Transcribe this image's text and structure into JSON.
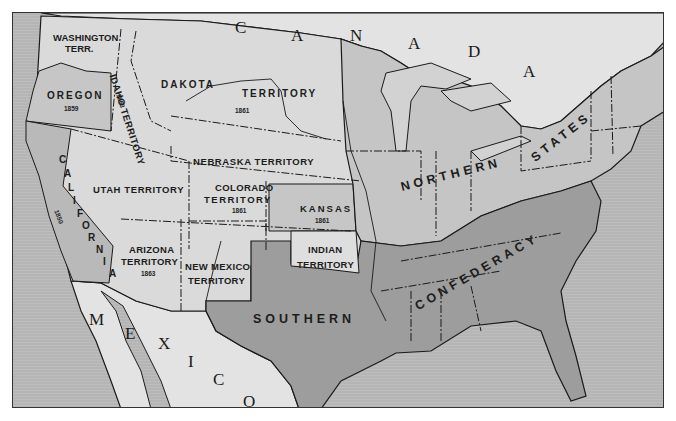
{
  "map": {
    "title": "United States, Territories and the Confederacy, c. 1861-1863",
    "colors": {
      "ocean": "#b5b5b5",
      "foreign_land": "#e2e2e2",
      "territory": "#d9d9d9",
      "northern_states": "#c4c4c4",
      "confederacy": "#9e9e9e",
      "border": "#1a1a1a",
      "frame": "#333333"
    },
    "countries": {
      "canada_letters": [
        "C",
        "A",
        "N",
        "A",
        "D",
        "A"
      ],
      "mexico_letters": [
        "M",
        "E",
        "X",
        "I",
        "C",
        "O"
      ]
    },
    "regions": {
      "washington": {
        "name_line1": "WASHINGTON",
        "name_line2": "TERR."
      },
      "oregon": {
        "name": "OREGON",
        "year": "1859"
      },
      "idaho": {
        "name": "IDAHO TERRITORY",
        "year": "1863"
      },
      "dakota": {
        "name_part1": "DAKOTA",
        "name_part2": "TERRITORY",
        "year": "1861"
      },
      "nebraska": {
        "name": "NEBRASKA TERRITORY"
      },
      "california": {
        "letters": [
          "C",
          "A",
          "L",
          "I",
          "F",
          "O",
          "R",
          "N",
          "I",
          "A"
        ],
        "year": "1850"
      },
      "utah": {
        "name": "UTAH TERRITORY"
      },
      "colorado": {
        "name_line1": "COLORADO",
        "name_line2": "TERRITORY",
        "year": "1861"
      },
      "kansas": {
        "name": "KANSAS",
        "year": "1861"
      },
      "arizona": {
        "name_line1": "ARIZONA",
        "name_line2": "TERRITORY",
        "year": "1863"
      },
      "new_mexico": {
        "name_line1": "NEW MEXICO",
        "name_line2": "TERRITORY"
      },
      "indian": {
        "name_line1": "INDIAN",
        "name_line2": "TERRITORY"
      }
    },
    "group_labels": {
      "northern": "NORTHERN",
      "states": "STATES",
      "southern": "SOUTHERN",
      "confederacy": "CONFEDERACY"
    }
  }
}
